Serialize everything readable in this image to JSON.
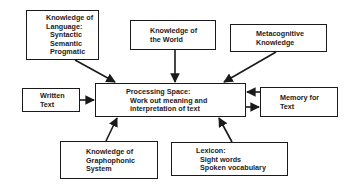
{
  "diagram": {
    "colors": {
      "line": "#1a1a1a",
      "text": "#222222",
      "background": "#ffffff"
    },
    "nodes": {
      "language": {
        "lines": [
          "Knowledge of",
          "Language:",
          "  Syntactic",
          "  Semantic",
          "  Progmatic"
        ]
      },
      "world": {
        "lines": [
          "Knowledge of",
          "the World"
        ]
      },
      "metacognitive": {
        "lines": [
          "Metacognitive",
          "Knowledge"
        ]
      },
      "written": {
        "lines": [
          "Written",
          "Text"
        ]
      },
      "processing": {
        "lines": [
          "Processing Space:",
          "  Work out meaning and",
          "  interpretation of text"
        ]
      },
      "memory": {
        "lines": [
          "Memory for",
          "Text"
        ]
      },
      "graphophonic": {
        "lines": [
          "Knowledge of",
          "Graphophonic",
          "System"
        ]
      },
      "lexicon": {
        "lines": [
          "Lexicon:",
          "  Sight words",
          "  Spoken vocabulary"
        ]
      }
    },
    "edges": [
      {
        "from": "language",
        "to": "processing"
      },
      {
        "from": "world",
        "to": "processing"
      },
      {
        "from": "metacognitive",
        "to": "processing"
      },
      {
        "from": "written",
        "to": "processing"
      },
      {
        "from": "memory",
        "to": "processing"
      },
      {
        "from": "processing",
        "to": "memory"
      },
      {
        "from": "graphophonic",
        "to": "processing"
      },
      {
        "from": "lexicon",
        "to": "processing"
      }
    ]
  }
}
